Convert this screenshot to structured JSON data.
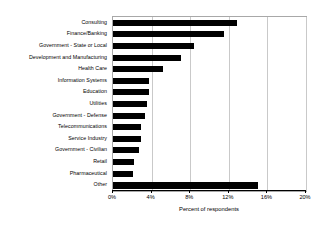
{
  "chart_data": {
    "type": "bar",
    "orientation": "horizontal",
    "title": "",
    "xlabel": "Percent of respondents",
    "ylabel": "",
    "xlim": [
      0,
      20
    ],
    "xticks": [
      0,
      4,
      8,
      12,
      16,
      20
    ],
    "xtick_labels": [
      "0%",
      "4%",
      "8%",
      "12%",
      "16%",
      "20%"
    ],
    "grid": "vertical",
    "legend": "none",
    "bar_color": "#000000",
    "grid_color": "#c9c9c9",
    "axis_color": "#000000",
    "categories": [
      "Consulting",
      "Finance/Banking",
      "Government - State or Local",
      "Development and Manufacturing",
      "Health Care",
      "Information Systems",
      "Education",
      "Utilities",
      "Government - Defense",
      "Telecommunications",
      "Service Industry",
      "Government - Civilian",
      "Retail",
      "Pharmaceutical",
      "Other"
    ],
    "values": [
      12.8,
      11.5,
      8.4,
      7.0,
      5.2,
      3.7,
      3.7,
      3.5,
      3.3,
      2.9,
      2.9,
      2.7,
      2.2,
      2.1,
      15.0
    ]
  }
}
